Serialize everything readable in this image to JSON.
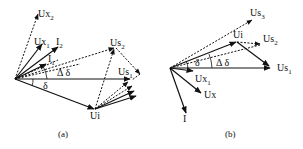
{
  "figure": {
    "panels": [
      {
        "id": "a",
        "caption": "(a)",
        "labels": {
          "ux2": {
            "main": "Ux",
            "sub": "2"
          },
          "ux1": {
            "main": "Ux",
            "sub": "1"
          },
          "i2": {
            "main": "I",
            "sub": "2"
          },
          "i1": {
            "main": "I",
            "sub": "1"
          },
          "us2": {
            "main": "Us",
            "sub": "2"
          },
          "us1": {
            "main": "Us",
            "sub": "1"
          },
          "ui": {
            "main": "Ui",
            "sub": ""
          },
          "delta": "δ",
          "delta_delta": "Δ δ"
        }
      },
      {
        "id": "b",
        "caption": "(b)",
        "labels": {
          "us3": {
            "main": "Us",
            "sub": "3"
          },
          "us2": {
            "main": "Us",
            "sub": "2"
          },
          "us1": {
            "main": "Us",
            "sub": "1"
          },
          "ui": {
            "main": "Ui",
            "sub": ""
          },
          "ux1": {
            "main": "Ux",
            "sub": "1"
          },
          "ux": {
            "main": "Ux",
            "sub": ""
          },
          "i": {
            "main": "I",
            "sub": ""
          },
          "delta": "δ",
          "delta_delta": "Δ δ"
        }
      }
    ]
  }
}
